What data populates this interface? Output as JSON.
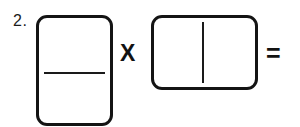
{
  "worksheet": {
    "problem_number": "2.",
    "multiply_sign": "X",
    "equals_sign": "=",
    "left_box": {
      "orientation": "vertical",
      "divider": "horizontal-fraction-bar",
      "top_value": "",
      "bottom_value": ""
    },
    "right_box": {
      "orientation": "horizontal",
      "divider": "vertical-bar",
      "left_value": "",
      "right_value": ""
    }
  },
  "colors": {
    "background": "#ffffff",
    "ink": "#141414"
  }
}
